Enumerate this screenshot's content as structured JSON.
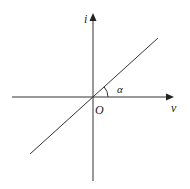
{
  "diagram": {
    "type": "coordinate-axes-with-line",
    "x_axis": {
      "label": "v",
      "from": [
        12,
        97
      ],
      "to": [
        173,
        97
      ]
    },
    "y_axis": {
      "label": "i",
      "from": [
        93,
        181
      ],
      "to": [
        93,
        14
      ]
    },
    "origin": {
      "label": "O",
      "x": 93,
      "y": 97
    },
    "line": {
      "from": [
        30,
        154
      ],
      "to": [
        158,
        38
      ]
    },
    "angle": {
      "label": "α",
      "radius": 15
    },
    "colors": {
      "stroke": "#333333",
      "background": "#ffffff"
    }
  }
}
